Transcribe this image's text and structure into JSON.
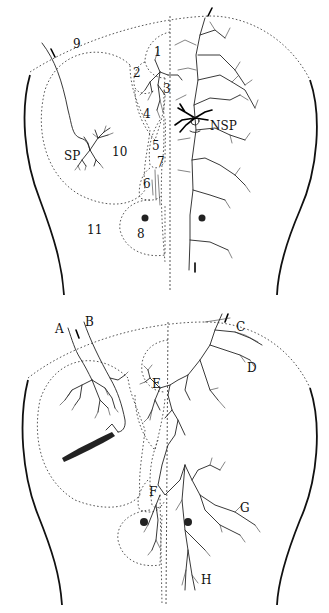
{
  "figure": {
    "panels": [
      {
        "id": "top",
        "region_labels": [
          "1",
          "2",
          "3",
          "4",
          "5",
          "6",
          "7",
          "8",
          "9",
          "10",
          "11"
        ],
        "cell_labels": [
          "SP",
          "NSP"
        ]
      },
      {
        "id": "bottom",
        "fiber_labels": [
          "A",
          "B",
          "C",
          "D",
          "E",
          "F",
          "G",
          "H"
        ]
      }
    ]
  },
  "top": {
    "labels": {
      "r1": "1",
      "r2": "2",
      "r3": "3",
      "r4": "4",
      "r5": "5",
      "r6": "6",
      "r7": "7",
      "r8": "8",
      "r9": "9",
      "r10": "10",
      "r11": "11",
      "sp": "SP",
      "nsp": "NSP"
    }
  },
  "bottom": {
    "labels": {
      "a": "A",
      "b": "B",
      "c": "C",
      "d": "D",
      "e": "E",
      "f": "F",
      "g": "G",
      "h": "H"
    }
  }
}
